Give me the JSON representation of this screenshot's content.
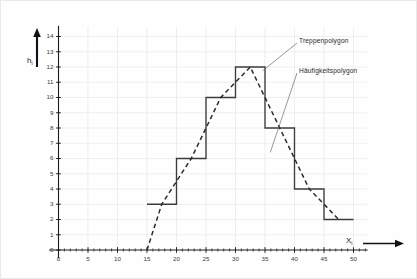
{
  "figure": {
    "background_color": "#fefefe",
    "grid_color": "#dfe3ea",
    "axis_color": "#1a1a1a",
    "step_color": "#3c3c3c",
    "polygon_color": "#2b2b2b"
  },
  "axes": {
    "y_label": "h",
    "y_label_sub": "i",
    "x_label": "X",
    "x_label_sub": "i",
    "y_ticks": [
      "0",
      "1",
      "2",
      "3",
      "4",
      "5",
      "6",
      "7",
      "8",
      "9",
      "10",
      "11",
      "12",
      "13",
      "14"
    ],
    "x_ticks": [
      "0",
      "5",
      "10",
      "15",
      "20",
      "25",
      "30",
      "35",
      "40",
      "45",
      "50"
    ]
  },
  "annotations": [
    {
      "name": "treppenpolygon-label",
      "text": "Treppenpolygon"
    },
    {
      "name": "haeufigkeitspolygon-label",
      "text": "Häufigkeitspolygon"
    }
  ],
  "chart_data": {
    "type": "bar",
    "title": "",
    "xlabel": "X_i",
    "ylabel": "h_i",
    "grid": true,
    "legend_position": "inline-annotations",
    "xlim": [
      0,
      52
    ],
    "ylim": [
      0,
      14
    ],
    "bin_edges": [
      15,
      20,
      25,
      30,
      35,
      40,
      45,
      50
    ],
    "categories": [
      "15-20",
      "20-25",
      "25-30",
      "30-35",
      "35-40",
      "40-45",
      "45-50"
    ],
    "values": [
      3,
      6,
      10,
      12,
      8,
      4,
      2
    ],
    "series": [
      {
        "name": "Treppenpolygon",
        "type": "step",
        "values": [
          3,
          6,
          10,
          12,
          8,
          4,
          2
        ]
      },
      {
        "name": "Häufigkeitspolygon",
        "type": "line",
        "style": "dashed",
        "x": [
          15,
          17.5,
          22.5,
          27.5,
          32.5,
          37.5,
          42.5,
          47.5
        ],
        "y": [
          0,
          3,
          6,
          10,
          12,
          8,
          4,
          2
        ]
      }
    ]
  }
}
